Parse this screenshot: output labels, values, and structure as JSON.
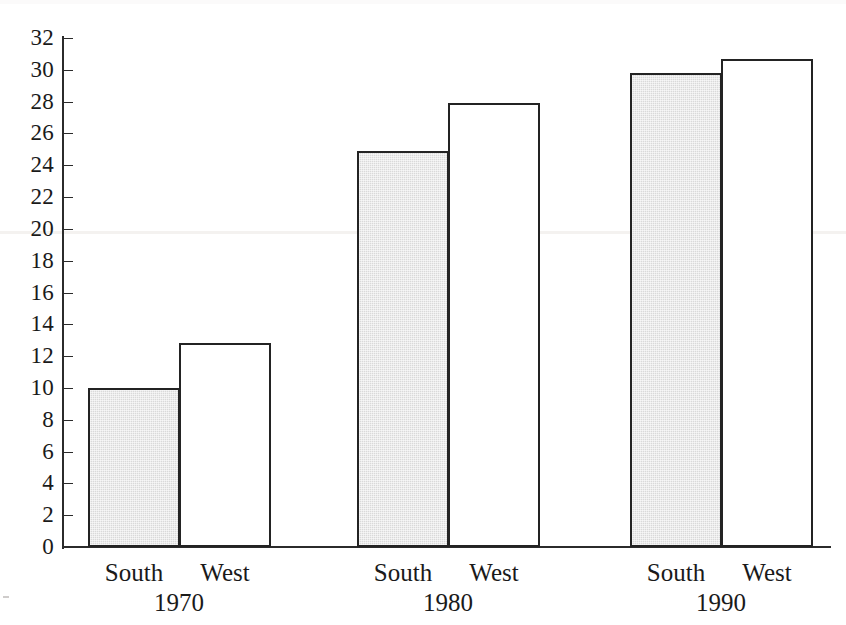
{
  "chart_data": {
    "type": "bar",
    "title": "",
    "subtitle": "",
    "xlabel": "",
    "ylabel": "",
    "ylim": [
      0,
      32
    ],
    "ytick_step": 2,
    "yticks": [
      0,
      2,
      4,
      6,
      8,
      10,
      12,
      14,
      16,
      18,
      20,
      22,
      24,
      26,
      28,
      30,
      32
    ],
    "grid": false,
    "legend_position": "none",
    "categories": [
      "1970",
      "1980",
      "1990"
    ],
    "group_member_labels": [
      "South",
      "West"
    ],
    "series": [
      {
        "name": "South",
        "values": [
          10.0,
          24.9,
          29.8
        ]
      },
      {
        "name": "West",
        "values": [
          12.85,
          27.9,
          30.7
        ]
      }
    ],
    "bars": [
      {
        "group": "1970",
        "series": "South",
        "value": 10.0,
        "style": "shaded"
      },
      {
        "group": "1970",
        "series": "West",
        "value": 12.85,
        "style": "plain"
      },
      {
        "group": "1980",
        "series": "South",
        "value": 24.9,
        "style": "shaded"
      },
      {
        "group": "1980",
        "series": "West",
        "value": 27.9,
        "style": "plain"
      },
      {
        "group": "1990",
        "series": "South",
        "value": 29.8,
        "style": "shaded"
      },
      {
        "group": "1990",
        "series": "West",
        "value": 30.7,
        "style": "plain"
      }
    ],
    "colors": {
      "shaded_fill": "#d9d9d9",
      "plain_fill": "#ffffff",
      "bar_outline": "#232323",
      "axis": "#2b2b2b",
      "text": "#1a1a1a",
      "background": "#ffffff"
    }
  },
  "axis": {
    "tick_labels": [
      "32",
      "30",
      "28",
      "26",
      "24",
      "22",
      "20",
      "18",
      "16",
      "14",
      "12",
      "10",
      "8",
      "6",
      "4",
      "2",
      "0"
    ]
  },
  "groups": [
    {
      "year": "1970",
      "members": [
        {
          "label": "South"
        },
        {
          "label": "West"
        }
      ]
    },
    {
      "year": "1980",
      "members": [
        {
          "label": "South"
        },
        {
          "label": "West"
        }
      ]
    },
    {
      "year": "1990",
      "members": [
        {
          "label": "South"
        },
        {
          "label": "West"
        }
      ]
    }
  ]
}
